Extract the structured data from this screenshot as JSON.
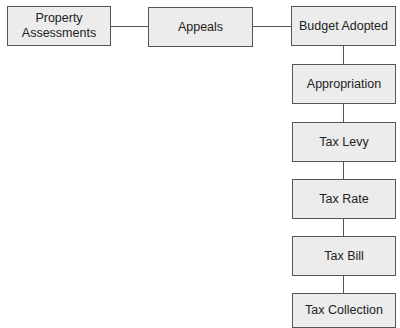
{
  "diagram": {
    "type": "flowchart",
    "colors": {
      "box_fill": "#ececec",
      "border": "#555555",
      "text": "#222222"
    },
    "nodes": [
      {
        "id": "property-assessments",
        "label": "Property\nAssessments"
      },
      {
        "id": "appeals",
        "label": "Appeals"
      },
      {
        "id": "budget-adopted",
        "label": "Budget Adopted"
      },
      {
        "id": "appropriation",
        "label": "Appropriation"
      },
      {
        "id": "tax-levy",
        "label": "Tax Levy"
      },
      {
        "id": "tax-rate",
        "label": "Tax Rate"
      },
      {
        "id": "tax-bill",
        "label": "Tax Bill"
      },
      {
        "id": "tax-collection",
        "label": "Tax Collection"
      }
    ],
    "edges": [
      [
        "property-assessments",
        "appeals"
      ],
      [
        "appeals",
        "budget-adopted"
      ],
      [
        "budget-adopted",
        "appropriation"
      ],
      [
        "appropriation",
        "tax-levy"
      ],
      [
        "tax-levy",
        "tax-rate"
      ],
      [
        "tax-rate",
        "tax-bill"
      ],
      [
        "tax-bill",
        "tax-collection"
      ]
    ]
  },
  "labels": {
    "property_line1": "Property",
    "property_line2": "Assessments",
    "appeals": "Appeals",
    "budget_adopted": "Budget Adopted",
    "appropriation": "Appropriation",
    "tax_levy": "Tax Levy",
    "tax_rate": "Tax Rate",
    "tax_bill": "Tax Bill",
    "tax_collection": "Tax Collection"
  }
}
